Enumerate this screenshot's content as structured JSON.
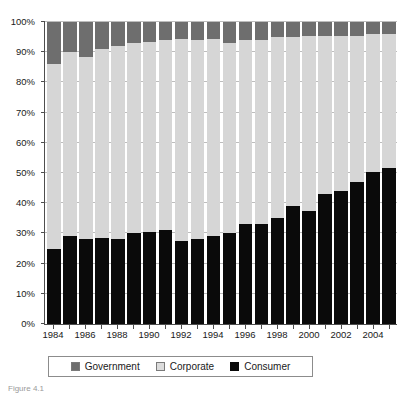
{
  "caption": "Figure 4.1",
  "legend": {
    "position": "bottom",
    "items": [
      {
        "label": "Government",
        "color": "#6e6e6e",
        "icon": "square-swatch-icon"
      },
      {
        "label": "Corporate",
        "color": "#dcdcdc",
        "icon": "square-swatch-icon"
      },
      {
        "label": "Consumer",
        "color": "#0a0a0a",
        "icon": "square-swatch-icon"
      }
    ]
  },
  "chart_data": {
    "type": "bar",
    "stacked": true,
    "stack_mode": "percent",
    "title": "",
    "subtitle": "",
    "xlabel": "",
    "ylabel": "",
    "ylim": [
      0,
      100
    ],
    "grid": true,
    "ytick_labels": [
      "0%",
      "10%",
      "20%",
      "30%",
      "40%",
      "50%",
      "60%",
      "70%",
      "80%",
      "90%",
      "100%"
    ],
    "ytick_values": [
      0,
      10,
      20,
      30,
      40,
      50,
      60,
      70,
      80,
      90,
      100
    ],
    "categories": [
      "1984",
      "1985",
      "1986",
      "1987",
      "1988",
      "1989",
      "1990",
      "1991",
      "1992",
      "1993",
      "1994",
      "1995",
      "1996",
      "1997",
      "1998",
      "1999",
      "2000",
      "2001",
      "2002",
      "2003",
      "2004",
      "2005"
    ],
    "xtick_labels_shown": [
      "1984",
      "1986",
      "1988",
      "1990",
      "1992",
      "1994",
      "1996",
      "1998",
      "2000",
      "2002",
      "2004"
    ],
    "series": [
      {
        "name": "Consumer",
        "color": "#0a0a0a",
        "values": [
          25.0,
          29.0,
          28.0,
          28.5,
          28.0,
          30.0,
          30.5,
          31.0,
          27.5,
          28.0,
          29.0,
          30.0,
          33.0,
          33.0,
          35.0,
          39.0,
          37.5,
          43.0,
          44.0,
          47.0,
          50.5,
          51.5
        ]
      },
      {
        "name": "Corporate",
        "color": "#d6d6d6",
        "values": [
          61.0,
          61.0,
          60.5,
          62.5,
          64.0,
          63.0,
          63.0,
          63.0,
          67.0,
          66.0,
          65.5,
          63.0,
          61.0,
          61.0,
          60.0,
          56.0,
          58.0,
          52.5,
          51.5,
          48.5,
          45.5,
          44.5
        ]
      },
      {
        "name": "Government",
        "color": "#6e6e6e",
        "values": [
          14.0,
          10.0,
          11.5,
          9.0,
          8.0,
          7.0,
          6.5,
          6.0,
          5.5,
          6.0,
          5.5,
          7.0,
          6.0,
          6.0,
          5.0,
          5.0,
          4.5,
          4.5,
          4.5,
          4.5,
          4.0,
          4.0
        ]
      }
    ]
  }
}
